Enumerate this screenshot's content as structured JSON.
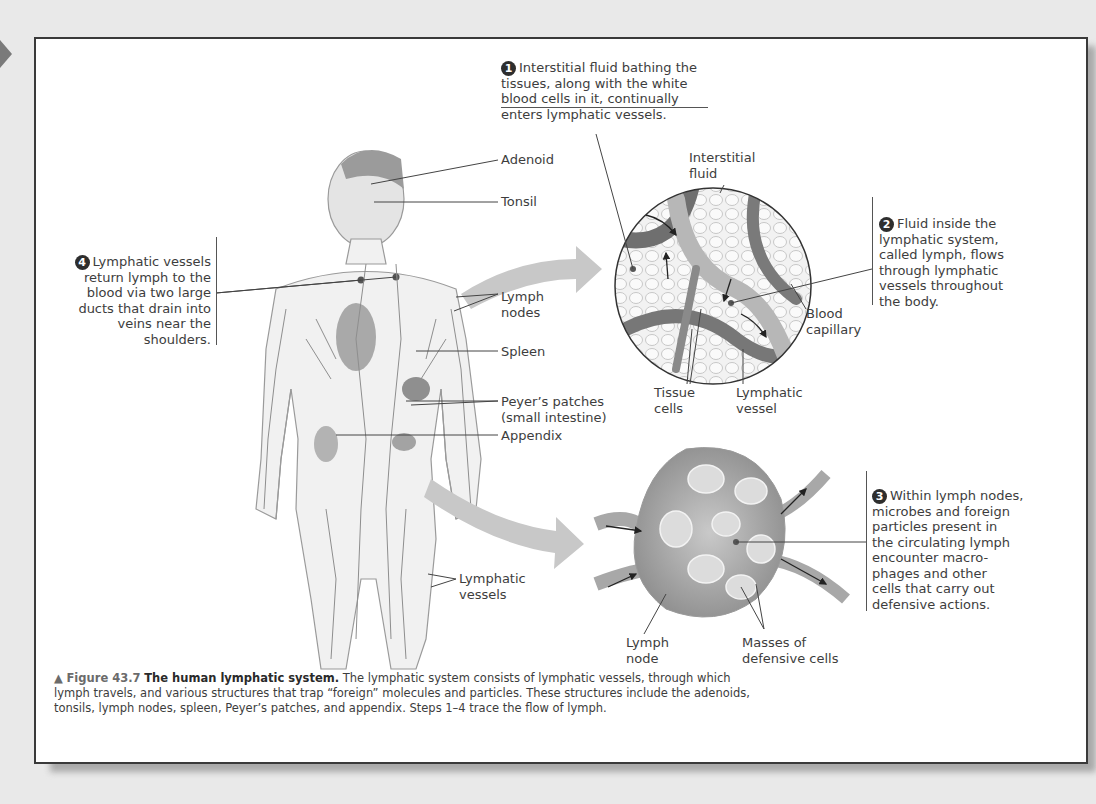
{
  "figure": {
    "number_label": "Figure 43.7",
    "title": "The human lymphatic system.",
    "caption": "The lymphatic system consists of lymphatic vessels, through which lymph travels, and various structures that trap “foreign” molecules and particles. These structures include the adenoids, tonsils, lymph nodes, spleen, Peyer’s patches, and appendix. Steps 1–4 trace the flow of lymph.",
    "marker_icon": "triangle-up-icon"
  },
  "steps": [
    {
      "number": "1",
      "text": "Interstitial fluid bathing the\ntissues, along with the white\nblood cells in it, continually\nenters lymphatic vessels."
    },
    {
      "number": "2",
      "text": "Fluid inside the\nlymphatic system,\ncalled lymph, flows\nthrough lymphatic\nvessels throughout\nthe body."
    },
    {
      "number": "3",
      "text": "Within lymph nodes,\nmicrobes and foreign\nparticles present in\nthe circulating lymph\nencounter macro-\nphages and other\ncells that carry out\ndefensive actions."
    },
    {
      "number": "4",
      "text": "Lymphatic vessels\nreturn lymph to the\nblood via two large\nducts that drain into\nveins near the\nshoulders."
    }
  ],
  "body_labels": {
    "adenoid": "Adenoid",
    "tonsil": "Tonsil",
    "lymph_nodes": "Lymph\nnodes",
    "spleen": "Spleen",
    "peyers_patches": "Peyer’s patches\n(small intestine)",
    "appendix": "Appendix",
    "lymphatic_vessels": "Lymphatic\nvessels"
  },
  "capillary_labels": {
    "interstitial_fluid": "Interstitial\nfluid",
    "blood_capillary": "Blood\ncapillary",
    "tissue_cells": "Tissue\ncells",
    "lymphatic_vessel": "Lymphatic\nvessel"
  },
  "node_labels": {
    "lymph_node": "Lymph\nnode",
    "masses": "Masses of\ndefensive cells"
  },
  "colors": {
    "frame_border": "#3a3a3a",
    "page_bg": "#e9e9e9",
    "text": "#3d3d3d",
    "step_badge": "#2e2e2e"
  }
}
